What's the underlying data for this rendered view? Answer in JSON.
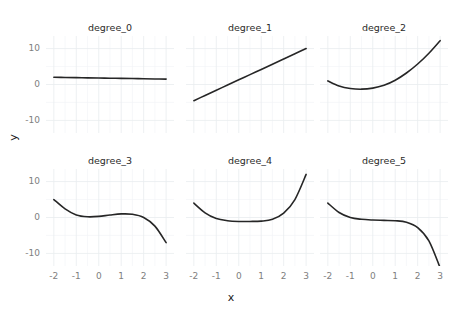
{
  "chart_data": {
    "type": "line",
    "title": "",
    "xlabel": "x",
    "ylabel": "y",
    "layout": {
      "rows": 2,
      "cols": 3,
      "facet_variable": "degree",
      "grid": true,
      "legend": "none"
    },
    "xlim": [
      -2.35,
      3.35
    ],
    "ylim": [
      -13.5,
      13.5
    ],
    "xticks": [
      -2,
      -1,
      0,
      1,
      2,
      3
    ],
    "xtick_labels": [
      "-2",
      "-1",
      "0",
      "1",
      "2",
      "3"
    ],
    "yticks": [
      -10,
      0,
      10
    ],
    "ytick_labels": [
      "-10",
      "0",
      "10"
    ],
    "facets": [
      {
        "label": "degree_0",
        "row": 0,
        "col": 0,
        "x": [
          -2,
          -1.5,
          -1,
          -0.5,
          0,
          0.5,
          1,
          1.5,
          2,
          2.5,
          3
        ],
        "y": [
          2.0,
          1.95,
          1.9,
          1.85,
          1.8,
          1.75,
          1.7,
          1.65,
          1.6,
          1.55,
          1.5
        ]
      },
      {
        "label": "degree_1",
        "row": 0,
        "col": 1,
        "x": [
          -2,
          -1.5,
          -1,
          -0.5,
          0,
          0.5,
          1,
          1.5,
          2,
          2.5,
          3
        ],
        "y": [
          -4.5,
          -3.05,
          -1.6,
          -0.15,
          1.3,
          2.75,
          4.2,
          5.65,
          7.1,
          8.55,
          10.0
        ]
      },
      {
        "label": "degree_2",
        "row": 0,
        "col": 2,
        "x": [
          -2,
          -1.5,
          -1,
          -0.5,
          0,
          0.5,
          1,
          1.5,
          2,
          2.5,
          3
        ],
        "y": [
          1.0,
          -0.4,
          -1.1,
          -1.3,
          -1.0,
          -0.2,
          1.2,
          3.2,
          5.7,
          8.7,
          12.2
        ]
      },
      {
        "label": "degree_3",
        "row": 1,
        "col": 0,
        "x": [
          -2,
          -1.5,
          -1,
          -0.5,
          0,
          0.5,
          1,
          1.5,
          2,
          2.5,
          3
        ],
        "y": [
          5.0,
          2.4,
          0.7,
          0.2,
          0.3,
          0.7,
          1.0,
          0.9,
          0.0,
          -2.4,
          -7.0
        ]
      },
      {
        "label": "degree_4",
        "row": 1,
        "col": 1,
        "x": [
          -2,
          -1.5,
          -1,
          -0.5,
          0,
          0.5,
          1,
          1.5,
          2,
          2.5,
          3
        ],
        "y": [
          4.0,
          1.3,
          -0.3,
          -0.9,
          -1.1,
          -1.1,
          -1.0,
          -0.5,
          1.2,
          5.0,
          12.0
        ]
      },
      {
        "label": "degree_5",
        "row": 1,
        "col": 2,
        "x": [
          -2,
          -1.5,
          -1,
          -0.5,
          0,
          0.5,
          1,
          1.5,
          2,
          2.5,
          3
        ],
        "y": [
          4.0,
          1.4,
          0.0,
          -0.5,
          -0.7,
          -0.8,
          -0.9,
          -1.3,
          -2.8,
          -6.5,
          -14.0
        ]
      }
    ]
  },
  "axes": {
    "x_title": "x",
    "y_title": "y"
  },
  "colors": {
    "curve": "#262626",
    "grid_major": "#e9ecef",
    "grid_minor": "#f2f4f6",
    "panel_background": "#ffffff",
    "tick_label": "#808080",
    "strip_label": "#2b2b2b"
  }
}
